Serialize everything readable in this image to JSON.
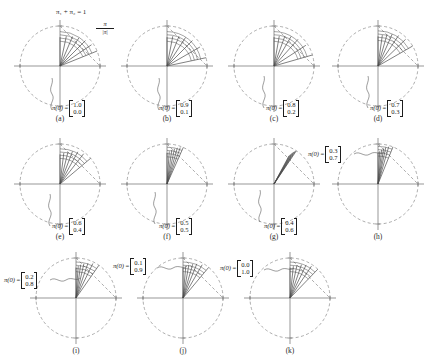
{
  "figure": {
    "simplex_note": "π₁ + π₂ = 1",
    "normalize_note_num": "π",
    "normalize_note_den": "|π|",
    "pi_symbol": "π(0)",
    "equals": "="
  },
  "geometry": {
    "radius": 40,
    "cx": 54,
    "cy": 52,
    "circle_color": "#8a8a8a",
    "axis_color": "#6b6b6b",
    "ray_color": "#4a4a4a",
    "simplex_color": "#8a8a8a",
    "leader_color": "#5a5a5a"
  },
  "panels": [
    {
      "id": "a",
      "caption": "(a)",
      "pi0": [
        "1.0",
        "0.0"
      ],
      "label_pos": "inside-lower-right",
      "label_x": 46,
      "label_y": 86,
      "rays": [
        90,
        78,
        67,
        56,
        45,
        34,
        22
      ],
      "ray_lengths": [
        0.72,
        0.76,
        0.8,
        0.85,
        0.9,
        0.95,
        1.0
      ],
      "arcs": [
        0.62,
        0.7,
        0.78,
        0.86
      ],
      "leader": "M 46 96 C 42 90 50 86 46 80 C 42 74 48 70 46 64"
    },
    {
      "id": "b",
      "caption": "(b)",
      "pi0": [
        "0.9",
        "0.1"
      ],
      "label_pos": "inside-lower-right",
      "label_x": 46,
      "label_y": 86,
      "rays": [
        90,
        79,
        68,
        57,
        45,
        30,
        12
      ],
      "ray_lengths": [
        0.72,
        0.76,
        0.8,
        0.85,
        0.9,
        0.95,
        1.0
      ],
      "arcs": [
        0.62,
        0.7,
        0.78,
        0.86
      ],
      "leader": "M 46 96 C 42 90 50 86 46 80 C 42 74 48 70 46 64"
    },
    {
      "id": "c",
      "caption": "(c)",
      "pi0": [
        "0.8",
        "0.2"
      ],
      "label_pos": "inside-lower-right",
      "label_x": 46,
      "label_y": 86,
      "rays": [
        90,
        80,
        70,
        60,
        48,
        33,
        16
      ],
      "ray_lengths": [
        0.72,
        0.76,
        0.8,
        0.85,
        0.9,
        0.95,
        1.0
      ],
      "arcs": [
        0.62,
        0.7,
        0.78,
        0.86
      ],
      "leader": "M 44 94 C 40 88 48 84 44 78 C 40 72 46 68 44 62"
    },
    {
      "id": "d",
      "caption": "(d)",
      "pi0": [
        "0.7",
        "0.3"
      ],
      "label_pos": "inside-lower-right",
      "label_x": 46,
      "label_y": 86,
      "rays": [
        90,
        82,
        74,
        66,
        56,
        44,
        30
      ],
      "ray_lengths": [
        0.74,
        0.78,
        0.82,
        0.87,
        0.92,
        0.96,
        1.0
      ],
      "arcs": [
        0.64,
        0.72,
        0.8,
        0.88
      ],
      "leader": "M 44 94 C 40 88 48 84 44 78 C 40 72 46 68 44 62"
    },
    {
      "id": "e",
      "caption": "(e)",
      "pi0": [
        "0.6",
        "0.4"
      ],
      "label_pos": "inside-lower-right",
      "label_x": 46,
      "label_y": 86,
      "rays": [
        90,
        83,
        76,
        69,
        61,
        52,
        40
      ],
      "ray_lengths": [
        0.74,
        0.78,
        0.82,
        0.87,
        0.92,
        0.96,
        1.0
      ],
      "arcs": [
        0.64,
        0.72,
        0.8,
        0.88
      ],
      "leader": "M 44 94 C 40 88 48 84 44 78 C 40 72 46 68 44 62"
    },
    {
      "id": "f",
      "caption": "(f)",
      "pi0": [
        "0.5",
        "0.5"
      ],
      "label_pos": "inside-lower-right",
      "label_x": 46,
      "label_y": 86,
      "rays": [
        90,
        86,
        82,
        78,
        74,
        70,
        66
      ],
      "ray_lengths": [
        0.78,
        0.82,
        0.86,
        0.9,
        0.94,
        0.97,
        1.0
      ],
      "arcs": [
        0.68,
        0.76,
        0.84,
        0.92
      ],
      "leader": "M 42 92 C 38 86 46 82 42 76 C 38 70 44 66 42 60"
    },
    {
      "id": "g",
      "caption": "(g)",
      "pi0": [
        "0.4",
        "0.6"
      ],
      "label_pos": "inside-lower-right",
      "label_x": 44,
      "label_y": 86,
      "rays": [
        62,
        61,
        60,
        59,
        58,
        57,
        56
      ],
      "ray_lengths": [
        0.8,
        0.84,
        0.88,
        0.92,
        0.95,
        0.98,
        1.0
      ],
      "arcs": [],
      "leader": "M 40 90 C 36 84 44 80 40 74 C 36 68 42 64 40 58"
    },
    {
      "id": "h",
      "caption": "(h)",
      "pi0": [
        "0.3",
        "0.7"
      ],
      "label_pos": "outside-upper-left",
      "label_x": -16,
      "label_y": 14,
      "rays": [
        90,
        87,
        84,
        81,
        78,
        74,
        68
      ],
      "ray_lengths": [
        0.78,
        0.82,
        0.86,
        0.9,
        0.94,
        0.97,
        1.0
      ],
      "arcs": [
        0.7,
        0.78,
        0.86,
        0.94
      ],
      "leader": "M 30 22 C 36 18 40 26 46 22 C 52 18 56 24 60 20"
    },
    {
      "id": "i",
      "caption": "(i)",
      "pi0": [
        "0.2",
        "0.8"
      ],
      "label_pos": "outside-upper-left",
      "label_x": -18,
      "label_y": 26,
      "rays": [
        90,
        86,
        82,
        77,
        71,
        64,
        55
      ],
      "ray_lengths": [
        0.76,
        0.8,
        0.84,
        0.88,
        0.92,
        0.96,
        1.0
      ],
      "arcs": [
        0.66,
        0.74,
        0.82,
        0.9
      ],
      "leader": "M 28 34 C 34 30 38 38 44 34 C 50 30 54 36 58 32"
    },
    {
      "id": "j",
      "caption": "(j)",
      "pi0": [
        "0.1",
        "0.9"
      ],
      "label_pos": "outside-upper-left",
      "label_x": -16,
      "label_y": 12,
      "rays": [
        90,
        85,
        80,
        74,
        68,
        60,
        50
      ],
      "ray_lengths": [
        0.76,
        0.8,
        0.84,
        0.88,
        0.92,
        0.96,
        1.0
      ],
      "arcs": [
        0.66,
        0.74,
        0.82,
        0.9
      ],
      "leader": "M 28 22 C 34 18 38 26 44 22 C 50 18 54 24 58 20"
    },
    {
      "id": "k",
      "caption": "(k)",
      "pi0": [
        "0.0",
        "1.0"
      ],
      "label_pos": "outside-upper-left",
      "label_x": -16,
      "label_y": 14,
      "rays": [
        90,
        84,
        78,
        71,
        64,
        56,
        46
      ],
      "ray_lengths": [
        0.76,
        0.8,
        0.84,
        0.88,
        0.92,
        0.96,
        1.0
      ],
      "arcs": [
        0.66,
        0.74,
        0.82,
        0.9
      ],
      "leader": "M 28 24 C 34 20 38 28 44 24 C 50 20 54 26 58 22"
    }
  ],
  "panel_positions": [
    {
      "id": "a",
      "x": 6,
      "y": 14
    },
    {
      "id": "b",
      "x": 113,
      "y": 14
    },
    {
      "id": "c",
      "x": 220,
      "y": 14
    },
    {
      "id": "d",
      "x": 324,
      "y": 14
    },
    {
      "id": "e",
      "x": 6,
      "y": 132
    },
    {
      "id": "f",
      "x": 113,
      "y": 132
    },
    {
      "id": "g",
      "x": 220,
      "y": 132
    },
    {
      "id": "h",
      "x": 324,
      "y": 132
    },
    {
      "id": "i",
      "x": 22,
      "y": 246
    },
    {
      "id": "j",
      "x": 129,
      "y": 246
    },
    {
      "id": "k",
      "x": 236,
      "y": 246
    }
  ]
}
